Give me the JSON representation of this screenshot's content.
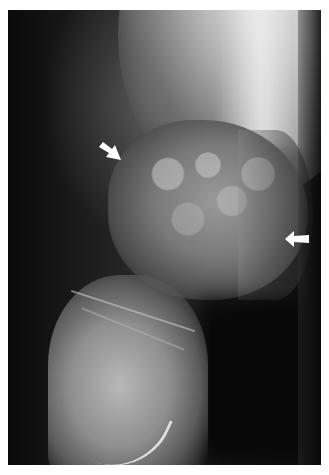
{
  "image": {
    "type": "radiograph",
    "description": "Lateral knee X-ray showing a mottled lesion in the distal femur",
    "frame_background": "#0c0c0c",
    "border_color": "#ffffff"
  },
  "annotations": {
    "arrows": [
      {
        "id": "arrow-upper-left",
        "direction": "down-right",
        "color": "#ffffff"
      },
      {
        "id": "arrow-right",
        "direction": "left",
        "color": "#ffffff"
      }
    ]
  }
}
